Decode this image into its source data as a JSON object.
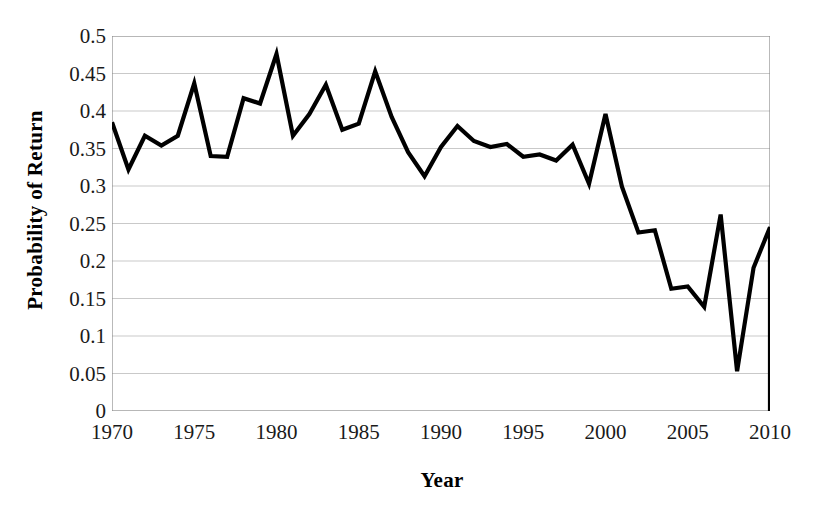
{
  "figure": {
    "background_color": "#ffffff",
    "line_color": "#000000",
    "gridline_color": "#c9c9c9",
    "axis_color": "#8a8a8a"
  },
  "axes": {
    "y_title": "Probability of Return",
    "x_title": "Year",
    "y_ticks": [
      "0",
      "0.05",
      "0.1",
      "0.15",
      "0.2",
      "0.25",
      "0.3",
      "0.35",
      "0.4",
      "0.45",
      "0.5"
    ],
    "x_ticks": [
      "1970",
      "1975",
      "1980",
      "1985",
      "1990",
      "1995",
      "2000",
      "2005",
      "2010"
    ]
  },
  "chart_data": {
    "type": "line",
    "title": "",
    "subtitle": "",
    "xlabel": "Year",
    "ylabel": "Probability of Return",
    "xlim": [
      1970,
      2010
    ],
    "ylim": [
      0,
      0.5
    ],
    "y_tick_step": 0.05,
    "x_tick_step": 5,
    "grid": "horizontal",
    "legend": "none",
    "annotations": [],
    "x": [
      1970,
      1971,
      1972,
      1973,
      1974,
      1975,
      1976,
      1977,
      1978,
      1979,
      1980,
      1981,
      1982,
      1983,
      1984,
      1985,
      1986,
      1987,
      1988,
      1989,
      1990,
      1991,
      1992,
      1993,
      1994,
      1995,
      1996,
      1997,
      1998,
      1999,
      2000,
      2001,
      2002,
      2003,
      2004,
      2005,
      2006,
      2007,
      2008,
      2009,
      2010
    ],
    "series": [
      {
        "name": "Probability of Return",
        "values": [
          0.385,
          0.322,
          0.367,
          0.354,
          0.367,
          0.437,
          0.34,
          0.339,
          0.417,
          0.41,
          0.476,
          0.367,
          0.396,
          0.435,
          0.375,
          0.383,
          0.453,
          0.392,
          0.345,
          0.313,
          0.352,
          0.38,
          0.36,
          0.352,
          0.356,
          0.339,
          0.342,
          0.334,
          0.355,
          0.303,
          0.396,
          0.299,
          0.238,
          0.241,
          0.163,
          0.166,
          0.139,
          0.262,
          0.053,
          0.191,
          0.245
        ]
      }
    ],
    "end_point": {
      "x": 2010,
      "y": -0.005,
      "note": "line drops below zero at right edge"
    }
  }
}
